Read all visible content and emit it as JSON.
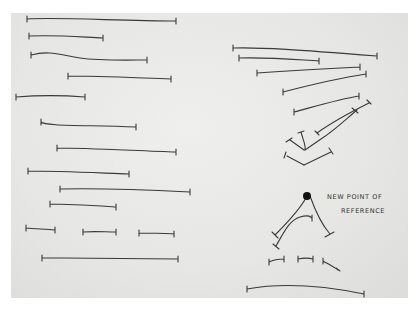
{
  "sketch": {
    "annotation_line1": "NEW POINT OF",
    "annotation_line2": "REFERENCE",
    "dot_color": "#111111",
    "ink_color": "#3a3a3a"
  }
}
